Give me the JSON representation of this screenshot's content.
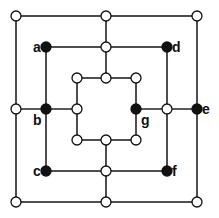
{
  "colors": {
    "line": "#222222",
    "empty": "#ffffff",
    "filled": "#111111"
  },
  "squares": [
    {
      "name": "outer",
      "x1": 16,
      "y1": 16,
      "x2": 197,
      "y2": 202
    },
    {
      "name": "middle",
      "x1": 46,
      "y1": 47,
      "x2": 167,
      "y2": 171
    },
    {
      "name": "inner",
      "x1": 77,
      "y1": 78,
      "x2": 136,
      "y2": 140
    }
  ],
  "connectors": [
    {
      "x1": 106,
      "y1": 16,
      "x2": 106,
      "y2": 78
    },
    {
      "x1": 106,
      "y1": 140,
      "x2": 106,
      "y2": 202
    },
    {
      "x1": 16,
      "y1": 109,
      "x2": 77,
      "y2": 109
    },
    {
      "x1": 136,
      "y1": 109,
      "x2": 197,
      "y2": 109
    }
  ],
  "points": [
    {
      "x": 16,
      "y": 16,
      "filled": false
    },
    {
      "x": 106,
      "y": 16,
      "filled": false
    },
    {
      "x": 197,
      "y": 16,
      "filled": false
    },
    {
      "x": 46,
      "y": 47,
      "filled": true,
      "label": "a",
      "lx": 33,
      "ly": 52
    },
    {
      "x": 106,
      "y": 47,
      "filled": false
    },
    {
      "x": 167,
      "y": 47,
      "filled": true,
      "label": "d",
      "lx": 172,
      "ly": 52
    },
    {
      "x": 77,
      "y": 78,
      "filled": false
    },
    {
      "x": 106,
      "y": 78,
      "filled": false
    },
    {
      "x": 136,
      "y": 78,
      "filled": false
    },
    {
      "x": 16,
      "y": 109,
      "filled": false
    },
    {
      "x": 46,
      "y": 109,
      "filled": true,
      "label": "b",
      "lx": 33,
      "ly": 125
    },
    {
      "x": 77,
      "y": 109,
      "filled": false
    },
    {
      "x": 136,
      "y": 109,
      "filled": true,
      "label": "g",
      "lx": 141,
      "ly": 125
    },
    {
      "x": 167,
      "y": 109,
      "filled": false
    },
    {
      "x": 197,
      "y": 109,
      "filled": true,
      "label": "e",
      "lx": 202,
      "ly": 114
    },
    {
      "x": 77,
      "y": 140,
      "filled": false
    },
    {
      "x": 106,
      "y": 140,
      "filled": false
    },
    {
      "x": 136,
      "y": 140,
      "filled": false
    },
    {
      "x": 46,
      "y": 171,
      "filled": true,
      "label": "c",
      "lx": 33,
      "ly": 176
    },
    {
      "x": 106,
      "y": 171,
      "filled": false
    },
    {
      "x": 167,
      "y": 171,
      "filled": true,
      "label": "f",
      "lx": 172,
      "ly": 176
    },
    {
      "x": 16,
      "y": 202,
      "filled": false
    },
    {
      "x": 106,
      "y": 202,
      "filled": false
    },
    {
      "x": 197,
      "y": 202,
      "filled": false
    }
  ]
}
